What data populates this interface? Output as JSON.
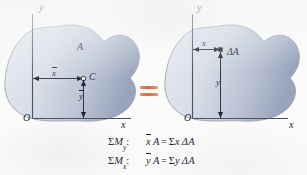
{
  "figure": {
    "type": "centroid-first-moment-diagram",
    "caption_equations": [
      {
        "id": "moment-about-y",
        "tag_sigma": "Σ",
        "tag_symbol": "M",
        "tag_subscript": "y",
        "tag_colon": ":",
        "lhs_bar_var": "x",
        "lhs_rest": "A",
        "operator": "=",
        "rhs_sigma": "Σ",
        "rhs_var": "x",
        "rhs_delta": "Δ",
        "rhs_area": "A"
      },
      {
        "id": "moment-about-x",
        "tag_sigma": "Σ",
        "tag_symbol": "M",
        "tag_subscript": "x",
        "tag_colon": ":",
        "lhs_bar_var": "y",
        "lhs_rest": "A",
        "operator": "=",
        "rhs_sigma": "Σ",
        "rhs_var": "y",
        "rhs_delta": "Δ",
        "rhs_area": "A"
      }
    ],
    "equals_between_panels": "=",
    "left_panel": {
      "name": "centroid-panel",
      "y_axis_label": "y",
      "x_axis_label": "x",
      "origin_label": "O",
      "area_label": "A",
      "centroid_point_label": "C",
      "xbar_label": "x",
      "ybar_label": "y"
    },
    "right_panel": {
      "name": "element-panel",
      "y_axis_label": "y",
      "x_axis_label": "x",
      "origin_label": "O",
      "element_label": "ΔA",
      "x_distance_label": "x",
      "y_distance_label": "y"
    }
  },
  "colors": {
    "page_background": "#fbfbfa",
    "area_fill_light": "#dfe3ea",
    "area_fill_dark": "#9aa6bd",
    "area_outline": "#7d8characters",
    "axis": "#4a5262",
    "text": "#1d2433",
    "equals_accent": "#d4693f"
  }
}
